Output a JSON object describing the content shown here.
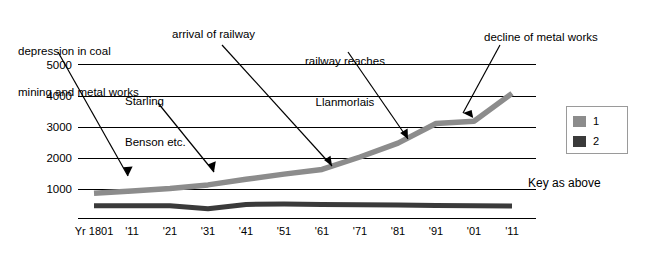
{
  "chart_data": {
    "type": "line",
    "title": "",
    "xlabel": "",
    "ylabel": "",
    "ylim": [
      0,
      5000
    ],
    "y_ticks": [
      0,
      1000,
      2000,
      3000,
      4000,
      5000
    ],
    "y_tick_labels": [
      "",
      "1000",
      "2000",
      "3000",
      "4000",
      "5000"
    ],
    "grid": true,
    "categories": [
      "Yr 1801",
      "'11",
      "'21",
      "'31",
      "'41",
      "'51",
      "'61",
      "'71",
      "'81",
      "'91",
      "'01",
      "'11"
    ],
    "legend_position": "right",
    "series": [
      {
        "name": "1",
        "color": "#8c8c8c",
        "values": [
          830,
          900,
          980,
          1100,
          1280,
          1450,
          1600,
          2000,
          2450,
          3080,
          3150,
          4050
        ]
      },
      {
        "name": "2",
        "color": "#3a3a3a",
        "values": [
          430,
          430,
          430,
          330,
          470,
          480,
          470,
          460,
          450,
          440,
          430,
          420
        ]
      }
    ],
    "annotations": [
      {
        "text": "depression in coal\nmining and metal works",
        "target_category": "'11",
        "target_value": 1050
      },
      {
        "text": "Starling\nBenson etc.",
        "target_category": "'31",
        "target_value": 1100
      },
      {
        "text": "arrival of railway",
        "target_category": "'61",
        "target_value": 1600
      },
      {
        "text": "railway reaches\nLlanmorlais",
        "target_category": "'81",
        "target_value": 2450
      },
      {
        "text": "decline of metal works",
        "target_category": "'91",
        "target_value": 3100
      }
    ]
  },
  "legend": {
    "items": [
      {
        "label": "1",
        "color": "#8c8c8c"
      },
      {
        "label": "2",
        "color": "#3a3a3a"
      }
    ]
  },
  "key_note": "Key as above",
  "axis": {
    "y_labels": [
      "5000",
      "4000",
      "3000",
      "2000",
      "1000"
    ],
    "x_labels": [
      "Yr 1801",
      "'11",
      "'21",
      "'31",
      "'41",
      "'51",
      "'61",
      "'71",
      "'81",
      "'91",
      "'01",
      "'11"
    ]
  },
  "annotations_text": {
    "a1_line1": "depression in coal",
    "a1_line2": "mining and metal works",
    "a2_line1": "Starling",
    "a2_line2": "Benson etc.",
    "a3": "arrival of railway",
    "a4_line1": "railway reaches",
    "a4_line2": "Llanmorlais",
    "a5": "decline of metal works"
  }
}
